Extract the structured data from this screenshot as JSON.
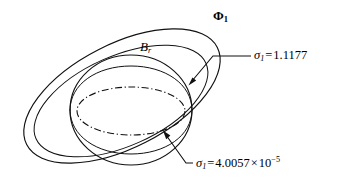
{
  "figure": {
    "title": "",
    "background_color": "#ffffff",
    "stroke_color": "#111111",
    "labels": {
      "outer_set": {
        "symbol": "Φ",
        "subscript": "1",
        "text": "Φ₁"
      },
      "ball": {
        "symbol": "B",
        "subscript": "r",
        "text": "B_r"
      },
      "sigma_top": {
        "symbol": "σ",
        "subscript": "1",
        "operator": "=",
        "value": "1.1177",
        "text": "σ₁ = 1.1177"
      },
      "sigma_bottom": {
        "symbol": "σ",
        "subscript": "1",
        "operator": "=",
        "value": "4.0057",
        "times": "×",
        "mantissa_base": "10",
        "exponent": "−5",
        "text": "σ₁ = 4.0057 × 10⁻⁵"
      }
    },
    "annotations": {
      "top_leader_target": "outer-boundary-ellipse",
      "bottom_leader_target": "inner-dashdot-ellipse"
    },
    "curves": [
      {
        "name": "outer-tilted-ellipse",
        "style": "solid",
        "description": "large tilted ellipse bounding the set Φ₁"
      },
      {
        "name": "ball-circle",
        "style": "solid",
        "description": "outline of the ball B_r"
      },
      {
        "name": "ball-equator-upper",
        "style": "solid",
        "description": "upper equator arc of the ball B_r"
      },
      {
        "name": "ball-equator-lower",
        "style": "solid",
        "description": "lower equator arc of the ball B_r"
      },
      {
        "name": "inner-dashdot-ellipse",
        "style": "dash-dot",
        "description": "inner dash-dot ellipse"
      },
      {
        "name": "secondary-tilted-ellipse",
        "style": "solid",
        "description": "second tilted ellipse nested inside Φ₁"
      }
    ]
  }
}
